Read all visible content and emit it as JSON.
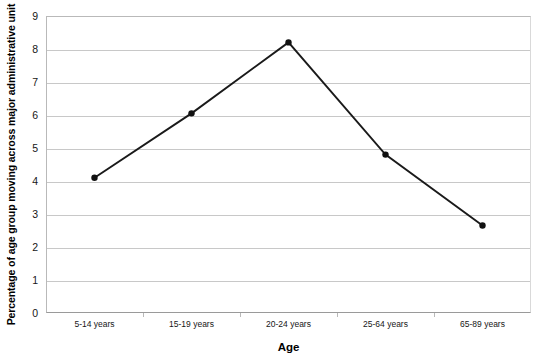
{
  "chart_data": {
    "type": "line",
    "title": "",
    "xlabel": "Age",
    "ylabel": "Percentage of age group moving across major administrative unit",
    "categories": [
      "5-14 years",
      "15-19 years",
      "20-24 years",
      "25-64 years",
      "65-89 years"
    ],
    "values": [
      4.1,
      6.05,
      8.2,
      4.8,
      2.65
    ],
    "series": [
      {
        "name": "Percentage of age group moving across major administrative unit",
        "values": [
          4.1,
          6.05,
          8.2,
          4.8,
          2.65
        ]
      }
    ],
    "ylim": [
      0,
      9
    ],
    "ytick_labels": [
      "0",
      "1",
      "2",
      "3",
      "4",
      "5",
      "6",
      "7",
      "8",
      "9"
    ],
    "ytick_values": [
      0,
      1,
      2,
      3,
      4,
      5,
      6,
      7,
      8,
      9
    ],
    "grid": true,
    "grid_axis": "y",
    "legend": false,
    "legend_position": "none",
    "marker": "filled-circle",
    "line_color": "#1a1a1a",
    "marker_color": "#111111",
    "gridline_color": "#c8c8c8",
    "plot_background": "#ffffff"
  },
  "axis": {
    "x_title": "Age",
    "y_title": "Percentage of age group moving across major administrative unit"
  }
}
